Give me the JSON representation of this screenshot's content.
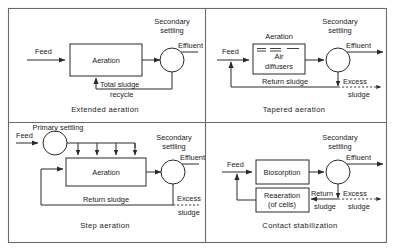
{
  "figure": {
    "panel_count": 4
  },
  "panels": [
    {
      "id": "extended-aeration",
      "caption": "Extended aeration",
      "labels": {
        "feed": "Feed",
        "reactor": "Aeration",
        "settling_line1": "Secondary",
        "settling_line2": "settling",
        "effluent": "Effluent",
        "recycle_line1": "Total sludge",
        "recycle_line2": "recycle"
      }
    },
    {
      "id": "tapered-aeration",
      "caption": "Tapered aeration",
      "labels": {
        "feed": "Feed",
        "reactor_title": "Aeration",
        "diffuser_line1": "Air",
        "diffuser_line2": "diffusers",
        "settling_line1": "Secondary",
        "settling_line2": "settling",
        "effluent": "Effluent",
        "return_sludge": "Return sludge",
        "excess_line1": "Excess",
        "excess_line2": "sludge"
      }
    },
    {
      "id": "step-aeration",
      "caption": "Step aeration",
      "labels": {
        "feed": "Feed",
        "primary_line1": "Primary settling",
        "reactor": "Aeration",
        "settling_line1": "Secondary",
        "settling_line2": "settling",
        "effluent": "Effluent",
        "return_sludge": "Return sludge",
        "excess_line1": "Excess",
        "excess_line2": "sludge"
      }
    },
    {
      "id": "contact-stabilization",
      "caption": "Contact stabilization",
      "labels": {
        "feed": "Feed",
        "contact_unit": "Biosorption",
        "reaeration_line1": "Reaeration",
        "reaeration_line2": "(of cells)",
        "settling_line1": "Secondary",
        "settling_line2": "settling",
        "effluent": "Effluent",
        "return_line1": "Return",
        "return_line2": "sludge",
        "excess_line1": "Excess",
        "excess_line2": "sludge"
      }
    }
  ],
  "colors": {
    "ink": "#2a2a2a",
    "frame": "#6b6b6b",
    "background": "#ffffff"
  }
}
